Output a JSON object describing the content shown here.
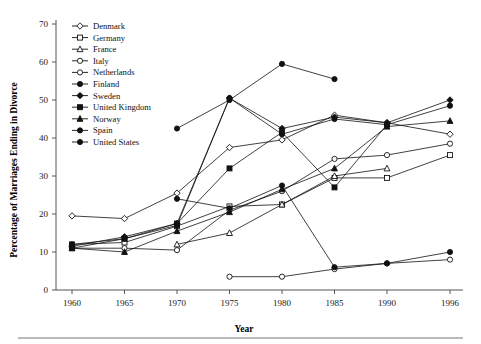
{
  "chart_data": {
    "type": "line",
    "title": "",
    "xlabel": "Year",
    "ylabel": "Percentage of Marriages Ending in Divorce",
    "x": [
      1960,
      1965,
      1970,
      1975,
      1980,
      1985,
      1990,
      1996
    ],
    "xtick_labels": [
      "1960",
      "1965",
      "1970",
      "1975",
      "1980",
      "1985",
      "1990",
      "1996"
    ],
    "ytick_labels": [
      "0",
      "10",
      "20",
      "30",
      "40",
      "50",
      "60",
      "70"
    ],
    "yticks": [
      0,
      10,
      20,
      30,
      40,
      50,
      60,
      70
    ],
    "ylim": [
      0,
      70
    ],
    "grid": false,
    "legend_position": "top-left-inside",
    "series": [
      {
        "name": "Denmark",
        "marker": "diamond-open",
        "values": [
          19.5,
          18.8,
          25.5,
          37.5,
          39.5,
          46.0,
          44.0,
          41.0
        ]
      },
      {
        "name": "Germany",
        "marker": "square-open",
        "values": [
          12.0,
          12.5,
          16.8,
          22.0,
          22.5,
          29.5,
          29.5,
          35.5
        ]
      },
      {
        "name": "France",
        "marker": "triangle-open",
        "values": [
          null,
          null,
          12.0,
          15.0,
          22.5,
          30.0,
          32.0,
          null
        ]
      },
      {
        "name": "Italy",
        "marker": "circle-open",
        "values": [
          null,
          null,
          null,
          3.5,
          3.5,
          5.5,
          7.0,
          8.0
        ]
      },
      {
        "name": "Netherlands",
        "marker": "circle-open",
        "values": [
          11.0,
          11.0,
          10.5,
          21.0,
          26.0,
          34.5,
          35.5,
          38.5
        ]
      },
      {
        "name": "Finland",
        "marker": "circle-filled",
        "values": [
          12.0,
          13.5,
          17.0,
          50.5,
          41.0,
          45.0,
          43.5,
          48.5
        ]
      },
      {
        "name": "Sweden",
        "marker": "diamond-filled",
        "values": [
          11.5,
          14.0,
          17.5,
          50.5,
          42.5,
          45.5,
          44.0,
          50.0
        ]
      },
      {
        "name": "United Kingdom",
        "marker": "square-filled",
        "values": [
          11.0,
          13.5,
          17.5,
          32.0,
          41.5,
          27.0,
          43.5,
          null
        ]
      },
      {
        "name": "Norway",
        "marker": "triangle-filled",
        "values": [
          11.0,
          10.0,
          15.5,
          20.5,
          26.5,
          32.0,
          43.0,
          44.5
        ]
      },
      {
        "name": "Spain",
        "marker": "circle-filled",
        "values": [
          null,
          null,
          24.0,
          21.5,
          27.5,
          6.0,
          7.0,
          10.0
        ]
      },
      {
        "name": "United States",
        "marker": "circle-filled",
        "values": [
          null,
          null,
          42.5,
          50.0,
          59.5,
          55.5,
          null,
          null
        ]
      }
    ]
  },
  "legend": {
    "items": [
      {
        "label": "Denmark",
        "marker": "diamond-open"
      },
      {
        "label": "Germany",
        "marker": "square-open"
      },
      {
        "label": "France",
        "marker": "triangle-open"
      },
      {
        "label": "Italy",
        "marker": "circle-open"
      },
      {
        "label": "Netherlands",
        "marker": "circle-open"
      },
      {
        "label": "Finland",
        "marker": "circle-filled"
      },
      {
        "label": "Sweden",
        "marker": "diamond-filled"
      },
      {
        "label": "United Kingdom",
        "marker": "square-filled"
      },
      {
        "label": "Norway",
        "marker": "triangle-filled"
      },
      {
        "label": "Spain",
        "marker": "circle-filled"
      },
      {
        "label": "United States",
        "marker": "circle-filled"
      }
    ]
  },
  "colors": {
    "ink": "#111111",
    "axis": "#555555",
    "background": "#ffffff",
    "rule": "#777777"
  }
}
